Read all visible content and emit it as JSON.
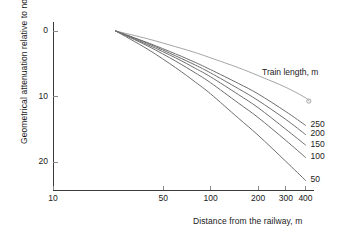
{
  "chart_data": {
    "type": "line",
    "title": "",
    "xlabel": "Distance from the railway, m",
    "ylabel": "Geometrical attenuation relative to noise level at 25 m",
    "legend_title": "Train length, m",
    "legend_position": "right-inline",
    "xscale": "log",
    "yscale": "linear",
    "xlim": [
      10,
      440
    ],
    "ylim": [
      25,
      -2
    ],
    "y_inverted": true,
    "grid": false,
    "xticks": [
      10,
      50,
      100,
      200,
      300,
      400
    ],
    "xtick_labels": [
      "10",
      "50",
      "100",
      "200",
      "300",
      "400"
    ],
    "yticks": [
      0,
      10,
      20
    ],
    "ytick_labels": [
      "0",
      "10",
      "20"
    ],
    "reference_point": {
      "x": 25,
      "y": 0
    },
    "marker": {
      "shape": "open-circle",
      "x": 420,
      "y": 10.7
    },
    "series": [
      {
        "name": "",
        "label": "",
        "color": "#9a9a9a",
        "x": [
          25,
          40,
          60,
          80,
          100,
          150,
          200,
          300,
          400,
          420
        ],
        "values": [
          0,
          1.2,
          2.4,
          3.3,
          4.1,
          5.6,
          6.8,
          8.6,
          10.2,
          10.7
        ]
      },
      {
        "name": "250",
        "label": "250",
        "color": "#6e6e6e",
        "x": [
          25,
          40,
          60,
          80,
          100,
          150,
          200,
          300,
          400
        ],
        "values": [
          0,
          1.8,
          3.5,
          4.8,
          5.9,
          8.0,
          9.6,
          12.3,
          14.4
        ]
      },
      {
        "name": "200",
        "label": "200",
        "color": "#6e6e6e",
        "x": [
          25,
          40,
          60,
          80,
          100,
          150,
          200,
          300,
          400
        ],
        "values": [
          0,
          1.9,
          3.8,
          5.2,
          6.4,
          8.8,
          10.6,
          13.5,
          15.8
        ]
      },
      {
        "name": "150",
        "label": "150",
        "color": "#6e6e6e",
        "x": [
          25,
          40,
          60,
          80,
          100,
          150,
          200,
          300,
          400
        ],
        "values": [
          0,
          2.1,
          4.1,
          5.7,
          7.0,
          9.7,
          11.7,
          15.0,
          17.4
        ]
      },
      {
        "name": "100",
        "label": "100",
        "color": "#6e6e6e",
        "x": [
          25,
          40,
          60,
          80,
          100,
          150,
          200,
          300,
          400
        ],
        "values": [
          0,
          2.3,
          4.6,
          6.4,
          7.9,
          11.0,
          13.2,
          16.7,
          19.3
        ]
      },
      {
        "name": "50",
        "label": "50",
        "color": "#6e6e6e",
        "x": [
          25,
          40,
          60,
          80,
          100,
          150,
          200,
          300,
          400
        ],
        "values": [
          0,
          2.8,
          5.6,
          7.8,
          9.6,
          13.3,
          15.9,
          19.9,
          22.8
        ]
      }
    ],
    "colors": {
      "axis": "#3a3a3a",
      "text": "#1a1a1a",
      "curve_primary": "#6e6e6e",
      "curve_top": "#9a9a9a",
      "background": "#ffffff"
    }
  }
}
